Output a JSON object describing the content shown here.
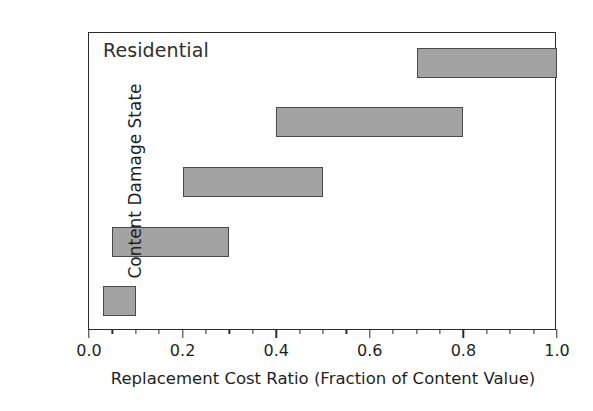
{
  "chart_data": {
    "type": "bar",
    "orientation": "horizontal",
    "bar_style": "range",
    "title": "",
    "annotation": "Residential",
    "xlabel": "Replacement Cost Ratio (Fraction of Content Value)",
    "ylabel": "Content Damage State",
    "xlim": [
      0.0,
      1.0
    ],
    "grid": false,
    "legend": null,
    "categories": [
      "D1",
      "D2",
      "D3",
      "D4",
      "D5"
    ],
    "xticks": [
      "0.0",
      "0.2",
      "0.4",
      "0.6",
      "0.8",
      "1.0"
    ],
    "xtick_values": [
      0.0,
      0.2,
      0.4,
      0.6,
      0.8,
      1.0
    ],
    "xtick_minor_interval": 0.05,
    "bars": [
      {
        "category": "D1",
        "start": 0.03,
        "end": 0.1
      },
      {
        "category": "D2",
        "start": 0.05,
        "end": 0.3
      },
      {
        "category": "D3",
        "start": 0.2,
        "end": 0.5
      },
      {
        "category": "D4",
        "start": 0.4,
        "end": 0.8
      },
      {
        "category": "D5",
        "start": 0.7,
        "end": 1.0
      }
    ],
    "series": [
      {
        "name": "start",
        "values": [
          0.03,
          0.05,
          0.2,
          0.4,
          0.7
        ]
      },
      {
        "name": "end",
        "values": [
          0.1,
          0.3,
          0.5,
          0.8,
          1.0
        ]
      }
    ],
    "colors": {
      "bar_fill": "#a3a3a3",
      "bar_edge": "#4a4a4a",
      "axis": "#2b2b2b",
      "text": "#1f1f1f",
      "background": "#ffffff"
    }
  }
}
